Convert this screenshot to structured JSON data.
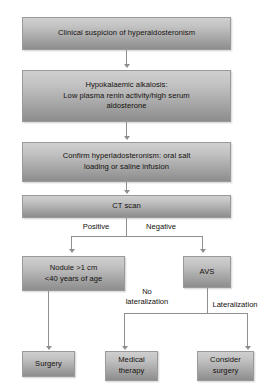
{
  "diagram": {
    "type": "flowchart",
    "background_color": "#ffffff",
    "node_fill_top": "#cfcfcf",
    "node_fill_bottom": "#8d8d8d",
    "connector_color": "#8f8f8f",
    "text_color": "#14100d",
    "nodes": [
      {
        "id": "suspicion",
        "label": "Clinical suspicion of hyperaldosteronism"
      },
      {
        "id": "hypokal",
        "label": "Hypokalaemic alkalosis:\nLow plasma renin activity/high serum\naldosterone"
      },
      {
        "id": "confirm",
        "label": "Confirm hyperladosteronism: oral salt\nloading or saline infusion"
      },
      {
        "id": "ct",
        "label": "CT scan"
      },
      {
        "id": "nodule",
        "label": "Nodule >1 cm\n<40 years of age"
      },
      {
        "id": "avs",
        "label": "AVS"
      },
      {
        "id": "surgery",
        "label": "Surgery"
      },
      {
        "id": "medical",
        "label": "Medical\ntherapy"
      },
      {
        "id": "consider",
        "label": "Consider\nsurgery"
      }
    ],
    "edge_labels": [
      {
        "id": "positive",
        "label": "Positive"
      },
      {
        "id": "negative",
        "label": "Negative"
      },
      {
        "id": "no-lateralization",
        "label": "No\nlateralization"
      },
      {
        "id": "lateralization",
        "label": "Lateralization"
      }
    ]
  }
}
